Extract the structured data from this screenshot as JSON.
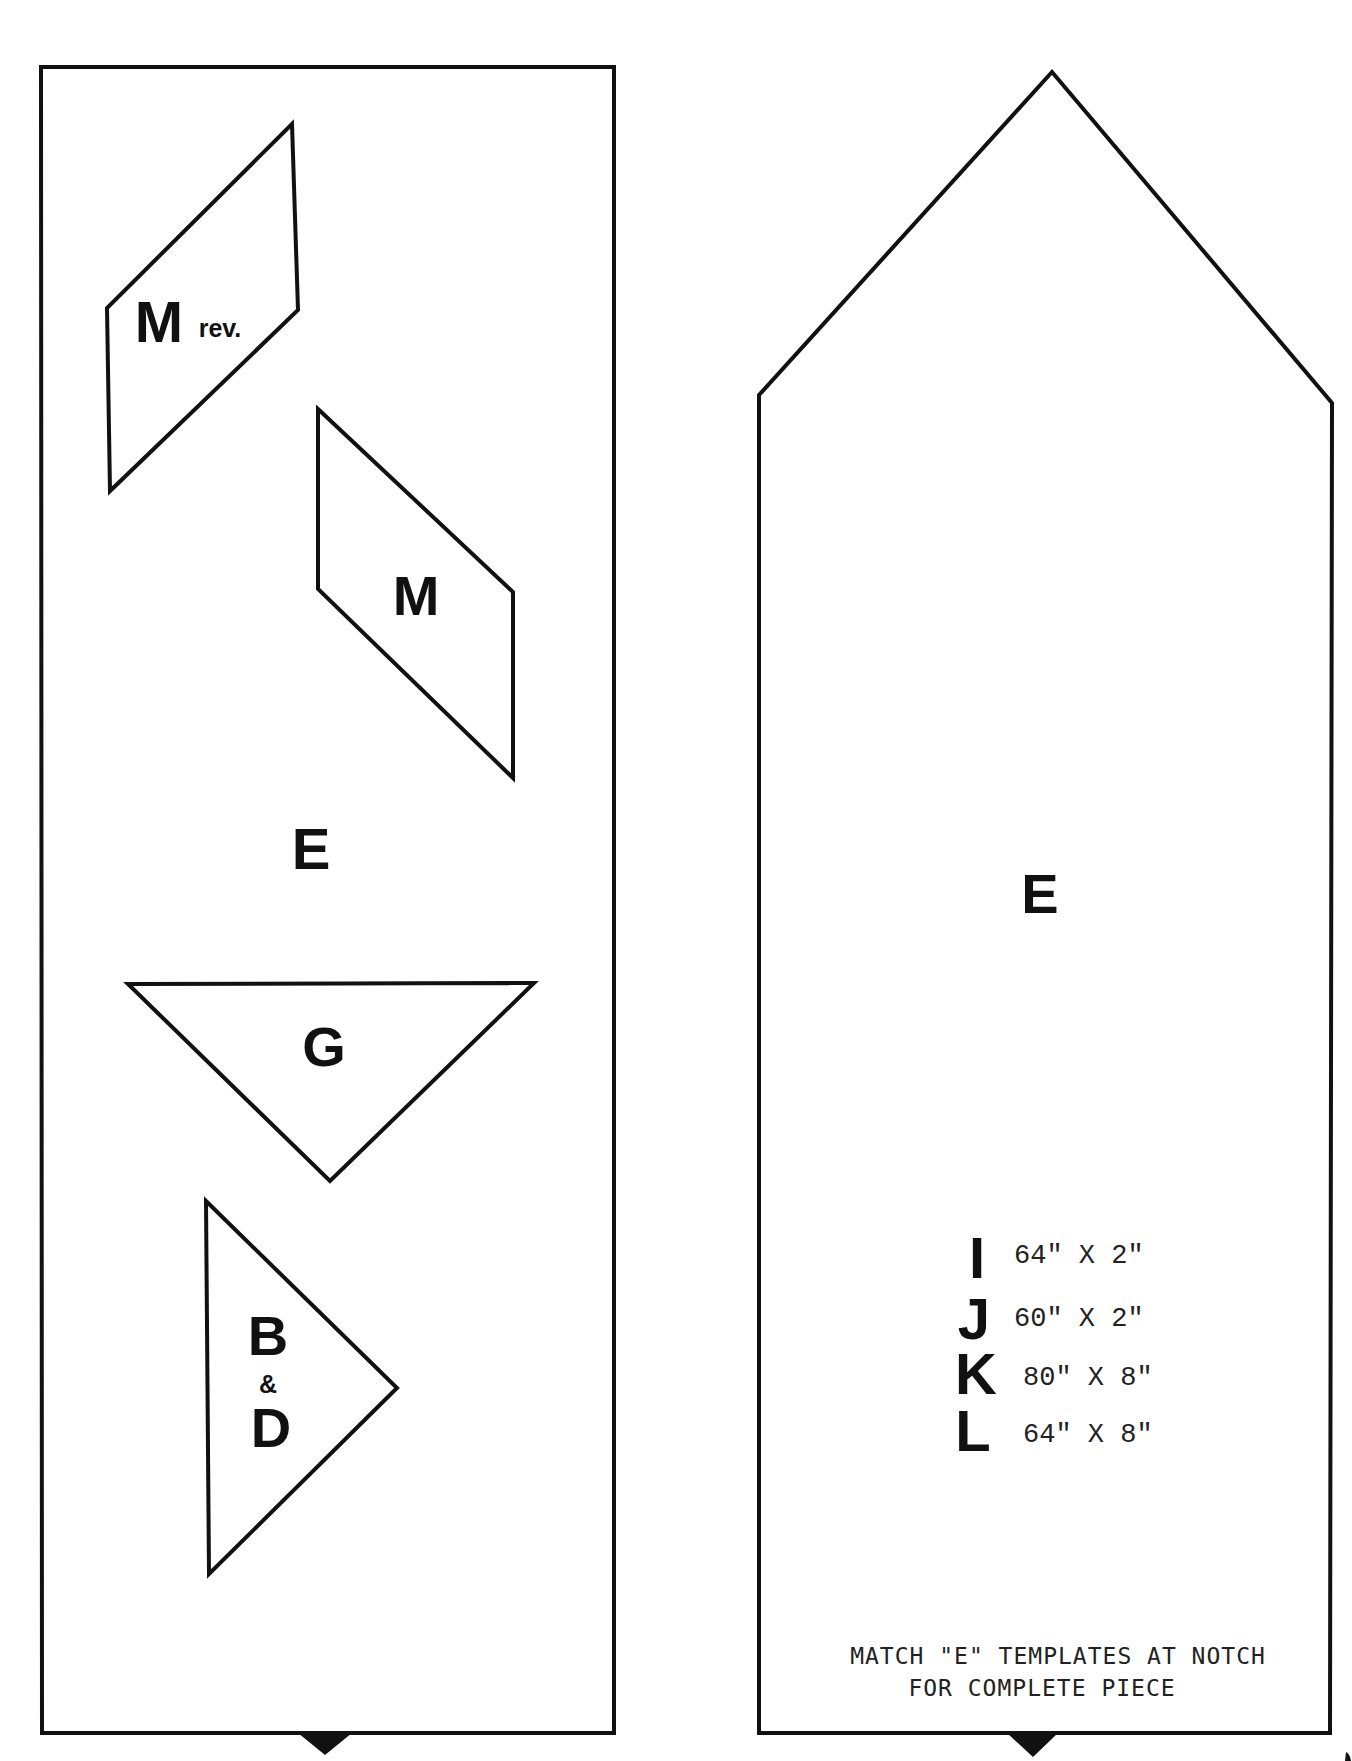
{
  "document": {
    "type": "quilt pattern templates",
    "colors": {
      "ink": "#111111",
      "paper": "#ffffff"
    }
  },
  "left_template": {
    "shape": "rectangle",
    "label": "E",
    "pieces": [
      {
        "id": "m-rev",
        "shape": "parallelogram",
        "letter": "M",
        "suffix": "rev."
      },
      {
        "id": "m",
        "shape": "parallelogram",
        "letter": "M"
      },
      {
        "id": "g",
        "shape": "triangle",
        "letter": "G"
      },
      {
        "id": "b-d",
        "shape": "triangle",
        "line1": "B",
        "amp": "&",
        "line2": "D"
      }
    ]
  },
  "right_template": {
    "shape": "pointed-rectangle",
    "label": "E",
    "strips": [
      {
        "letter": "I",
        "size": "64\" X 2\""
      },
      {
        "letter": "J",
        "size": "60\" X 2\""
      },
      {
        "letter": "K",
        "size": "80\" X 8\""
      },
      {
        "letter": "L",
        "size": "64\" X 8\""
      }
    ],
    "note": {
      "line1": "MATCH \"E\" TEMPLATES AT NOTCH",
      "line2": "FOR COMPLETE PIECE"
    }
  }
}
